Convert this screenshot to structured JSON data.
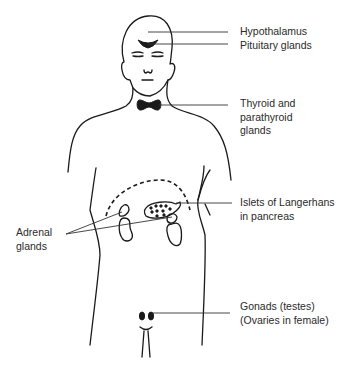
{
  "diagram": {
    "colors": {
      "line": "#1a1a1a",
      "text": "#2a2a2a",
      "background": "#ffffff"
    },
    "labels": {
      "hypothalamus": [
        "Hypothalamus"
      ],
      "pituitary": [
        "Pituitary glands"
      ],
      "thyroid": [
        "Thyroid and",
        "parathyroid",
        "glands"
      ],
      "islets": [
        "Islets of Langerhans",
        "in pancreas"
      ],
      "adrenal": [
        "Adrenal",
        "glands"
      ],
      "gonads": [
        "Gonads (testes)",
        "(Ovaries in female)"
      ]
    }
  }
}
